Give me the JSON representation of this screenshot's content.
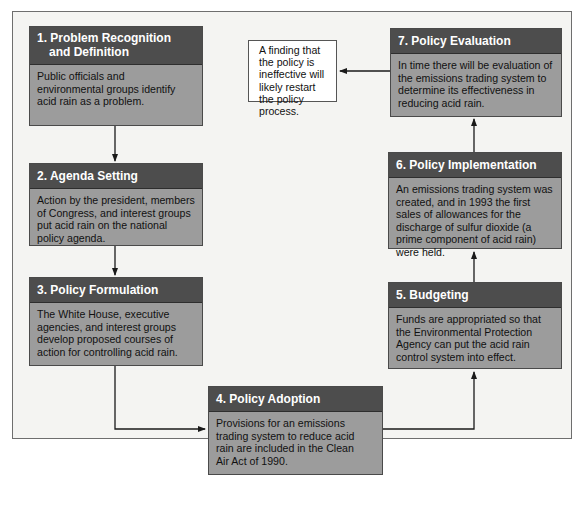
{
  "figure": {
    "title_partial": "The Policy Making Process: Acid Rain Regulation"
  },
  "stages": [
    {
      "number": "1.",
      "title_line1": "1. Problem Recognition",
      "title_line2": "and Definition",
      "body": "Public officials and environmental groups identify acid rain as a problem."
    },
    {
      "number": "2.",
      "title": "2. Agenda Setting",
      "body": "Action by the president, members of Congress, and interest groups put acid rain on the national policy agenda."
    },
    {
      "number": "3.",
      "title": "3. Policy Formulation",
      "body": "The White House, executive agencies, and interest groups develop proposed courses of action for controlling acid rain."
    },
    {
      "number": "4.",
      "title": "4. Policy Adoption",
      "body": "Provisions for an emissions trading system to reduce acid rain are included in the Clean Air Act of 1990."
    },
    {
      "number": "5.",
      "title": "5. Budgeting",
      "body": "Funds are appropriated so that the Environmental Protection Agency can put the acid rain control system into effect."
    },
    {
      "number": "6.",
      "title": "6. Policy Implementation",
      "body": "An emissions trading system was created, and in 1993 the first sales of allowances for the discharge of sulfur dioxide (a prime component of acid rain) were held."
    },
    {
      "number": "7.",
      "title": "7. Policy Evaluation",
      "body": "In time there will be evaluation of the emissions trading system to determine its effectiveness in reducing acid rain."
    }
  ],
  "note": {
    "text": "A finding that the policy is ineffective will likely restart the policy process."
  },
  "flow": [
    {
      "from": "stage-1",
      "to": "stage-2"
    },
    {
      "from": "stage-2",
      "to": "stage-3"
    },
    {
      "from": "stage-3",
      "to": "stage-4"
    },
    {
      "from": "stage-4",
      "to": "stage-5"
    },
    {
      "from": "stage-5",
      "to": "stage-6"
    },
    {
      "from": "stage-6",
      "to": "stage-7"
    },
    {
      "from": "stage-7",
      "to": "note"
    }
  ],
  "colors": {
    "header_bg": "#4d4d4d",
    "body_bg": "#9c9c9c",
    "frame_bg": "#f4f4f2",
    "note_bg": "#ffffff",
    "connector": "#1a1a1a"
  }
}
